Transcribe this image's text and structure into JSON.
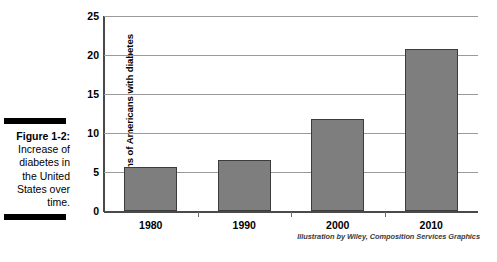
{
  "figure": {
    "label": "Figure 1-2:",
    "caption": " Increase of diabetes in the United States over time."
  },
  "attribution": "Illustration by Wiley, Composition Services Graphics",
  "colors": {
    "bar_fill": "#7e7e7e",
    "bar_stroke": "#3c3c3c",
    "gridline": "#9a9a9a",
    "axis": "#4a4a4a",
    "text": "#000000"
  },
  "chart_data": {
    "type": "bar",
    "title": "",
    "xlabel": "",
    "ylabel": "Millions of Americans with diabetes",
    "categories": [
      "1980",
      "1990",
      "2000",
      "2010"
    ],
    "values": [
      5.6,
      6.5,
      11.8,
      20.8
    ],
    "ylim": [
      0,
      25
    ],
    "yticks": [
      0,
      5,
      10,
      15,
      20,
      25
    ],
    "ytick_labels": [
      "0",
      "5",
      "10",
      "15",
      "20",
      "25"
    ],
    "grid": true,
    "legend": false,
    "legend_position": "none"
  }
}
